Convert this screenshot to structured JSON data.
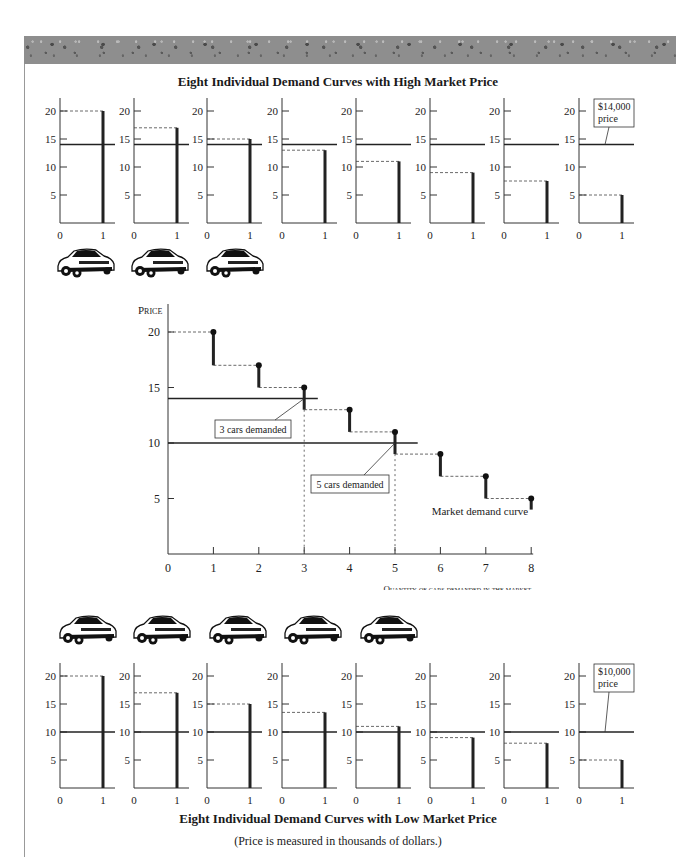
{
  "top_title": "Eight Individual Demand Curves with High Market Price",
  "bottom_title": "Eight Individual Demand Curves with Low Market Price",
  "footnote": "(Price is measured in thousands of dollars.)",
  "high_price_label_line1": "$14,000",
  "high_price_label_line2": "price",
  "low_price_label_line1": "$10,000",
  "low_price_label_line2": "price",
  "main_chart": {
    "ylabel": "Price",
    "xlabel": "Quantity of cars demanded in the market",
    "annotation_3": "3 cars demanded",
    "annotation_5": "5 cars demanded",
    "curve_label": "Market demand curve"
  },
  "mini_ticks": {
    "y": [
      "20",
      "15",
      "10",
      "5"
    ],
    "x": [
      "0",
      "1"
    ]
  },
  "main_ticks": {
    "y": [
      "20",
      "15",
      "10",
      "5"
    ],
    "x": [
      "0",
      "1",
      "2",
      "3",
      "4",
      "5",
      "6",
      "7",
      "8"
    ]
  },
  "cars_top_count": 3,
  "cars_bottom_count": 5,
  "chart_data": [
    {
      "type": "bar",
      "title": "Eight Individual Demand Curves with High Market Price",
      "xlabel": "Quantity",
      "ylabel": "Price (thousands of $)",
      "categories": [
        "Buyer 1",
        "Buyer 2",
        "Buyer 3",
        "Buyer 4",
        "Buyer 5",
        "Buyer 6",
        "Buyer 7",
        "Buyer 8"
      ],
      "values": [
        20,
        17,
        15,
        13,
        11,
        9,
        7.5,
        5
      ],
      "market_price": 14,
      "ylim": [
        0,
        22
      ],
      "xlim": [
        0,
        1
      ],
      "annotation": "$14,000 price",
      "cars_demanded": 3
    },
    {
      "type": "line",
      "title": "Market demand curve",
      "xlabel": "Quantity of cars demanded in the market",
      "ylabel": "Price",
      "x": [
        1,
        2,
        3,
        4,
        5,
        6,
        7,
        8
      ],
      "series": [
        {
          "name": "Market demand curve",
          "values": [
            20,
            17,
            15,
            13,
            11,
            9,
            7,
            5
          ]
        }
      ],
      "step_bottoms": [
        17,
        15,
        13,
        11,
        9,
        7,
        5,
        4
      ],
      "horizontal_lines": [
        14,
        10
      ],
      "annotations": [
        "3 cars demanded",
        "5 cars demanded",
        "Market demand curve"
      ],
      "xlim": [
        0,
        8
      ],
      "ylim": [
        0,
        21
      ]
    },
    {
      "type": "bar",
      "title": "Eight Individual Demand Curves with Low Market Price",
      "xlabel": "Quantity",
      "ylabel": "Price (thousands of $)",
      "categories": [
        "Buyer 1",
        "Buyer 2",
        "Buyer 3",
        "Buyer 4",
        "Buyer 5",
        "Buyer 6",
        "Buyer 7",
        "Buyer 8"
      ],
      "values": [
        20,
        17,
        15,
        13.5,
        11,
        9,
        8,
        5
      ],
      "market_price": 10,
      "ylim": [
        0,
        22
      ],
      "xlim": [
        0,
        1
      ],
      "annotation": "$10,000 price",
      "cars_demanded": 5
    }
  ]
}
